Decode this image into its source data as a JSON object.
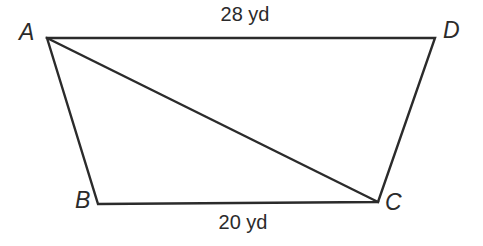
{
  "figure": {
    "type": "quadrilateral-with-diagonal",
    "shape_name": "ABCD",
    "stroke_color": "#2b2b2b",
    "background_color": "#ffffff",
    "stroke_width": 2,
    "vertices": [
      {
        "name": "A",
        "label": "A",
        "x": 47,
        "y": 38
      },
      {
        "name": "B",
        "label": "B",
        "x": 98,
        "y": 204
      },
      {
        "name": "C",
        "label": "C",
        "x": 378,
        "y": 202
      },
      {
        "name": "D",
        "label": "D",
        "x": 435,
        "y": 38
      }
    ],
    "edges": [
      {
        "name": "AD",
        "from": "A",
        "to": "D",
        "kind": "side",
        "label": "28 yd"
      },
      {
        "name": "DC",
        "from": "D",
        "to": "C",
        "kind": "side",
        "label": ""
      },
      {
        "name": "CB",
        "from": "C",
        "to": "B",
        "kind": "side",
        "label": "20 yd"
      },
      {
        "name": "BA",
        "from": "B",
        "to": "A",
        "kind": "side",
        "label": ""
      },
      {
        "name": "AC",
        "from": "A",
        "to": "C",
        "kind": "diagonal",
        "label": ""
      }
    ],
    "measurements": {
      "top_edge": "28 yd",
      "bottom_edge": "20 yd"
    },
    "path_outline": "M 47 38 L 435 38 L 378 202 L 98 204 Z",
    "path_diagonal": "M 47 38 L 378 202"
  }
}
